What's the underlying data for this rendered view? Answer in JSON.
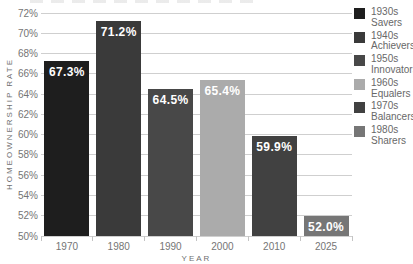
{
  "chart_data": {
    "type": "bar",
    "title": "",
    "xlabel": "YEAR",
    "ylabel": "HOMEOWNERSHIP RATE",
    "categories": [
      "1970",
      "1980",
      "1990",
      "2000",
      "2010",
      "2025"
    ],
    "values": [
      67.3,
      71.2,
      64.5,
      65.4,
      59.9,
      52.0
    ],
    "bar_labels": [
      "67.3%",
      "71.2%",
      "64.5%",
      "65.4%",
      "59.9%",
      "52.0%"
    ],
    "bar_colors": [
      "#1e1e1e",
      "#3a3a3a",
      "#484848",
      "#ababab",
      "#414141",
      "#767676"
    ],
    "value_label_color": "#ffffff",
    "ylim": [
      50,
      72
    ],
    "yticks": [
      "50%",
      "52%",
      "54%",
      "56%",
      "58%",
      "60%",
      "62%",
      "64%",
      "66%",
      "68%",
      "70%",
      "72%"
    ],
    "grid": "horizontal",
    "grid_color": "#cfcfcf",
    "axis_text_color": "#757575",
    "legend_position": "right",
    "legend": [
      {
        "decade": "1930s",
        "name": "Savers",
        "color": "#1e1e1e"
      },
      {
        "decade": "1940s",
        "name": "Achievers",
        "color": "#3a3a3a"
      },
      {
        "decade": "1950s",
        "name": "Innovators",
        "color": "#484848"
      },
      {
        "decade": "1960s",
        "name": "Equalers",
        "color": "#ababab"
      },
      {
        "decade": "1970s",
        "name": "Balancers",
        "color": "#414141"
      },
      {
        "decade": "1980s",
        "name": "Sharers",
        "color": "#767676"
      }
    ]
  }
}
